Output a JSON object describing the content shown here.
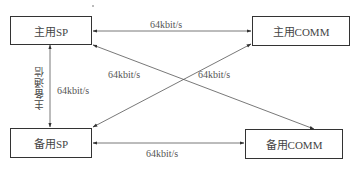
{
  "diagram": {
    "nodes": {
      "main_sp": {
        "label": "主用SP"
      },
      "main_comm": {
        "label": "主用COMM"
      },
      "backup_sp": {
        "label": "备用SP"
      },
      "backup_comm": {
        "label": "备用COMM"
      }
    },
    "links": {
      "main_sp_main_comm": {
        "label": "64kbit/s"
      },
      "main_sp_backup_sp": {
        "label": "64kbit/s",
        "side_label": "主备通信"
      },
      "main_sp_backup_comm": {
        "label": "64kbit/s"
      },
      "backup_sp_main_comm": {
        "label": "64kbit/s"
      },
      "backup_sp_backup_comm": {
        "label": "64kbit/s"
      }
    },
    "colors": {
      "line": "#444444",
      "border": "#333333",
      "text": "#444444"
    }
  }
}
